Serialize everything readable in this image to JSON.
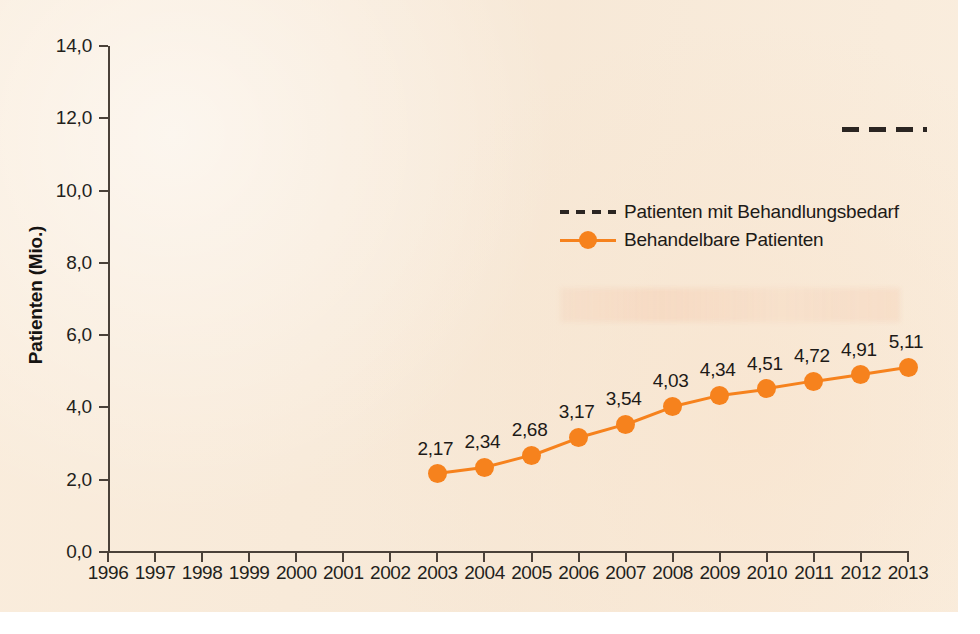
{
  "figure": {
    "background_color": "#f8ead8",
    "accent_color": "#f6821d",
    "dash_color": "#2b2522"
  },
  "axes": {
    "y_title": "Patienten (Mio.)",
    "y_ticks": [
      "0,0",
      "2,0",
      "4,0",
      "6,0",
      "8,0",
      "10,0",
      "12,0",
      "14,0"
    ],
    "x_ticks": [
      "1996",
      "1997",
      "1998",
      "1999",
      "2000",
      "2001",
      "2002",
      "2003",
      "2004",
      "2005",
      "2006",
      "2007",
      "2008",
      "2009",
      "2010",
      "2011",
      "2012",
      "2013"
    ]
  },
  "legend": {
    "items": [
      {
        "label": "Patienten mit Behandlungsbedarf",
        "style": "dashed",
        "color": "#2b2522"
      },
      {
        "label": "Behandelbare Patienten",
        "style": "line-marker",
        "color": "#f6821d"
      }
    ]
  },
  "point_labels": [
    "2,17",
    "2,34",
    "2,68",
    "3,17",
    "3,54",
    "4,03",
    "4,34",
    "4,51",
    "4,72",
    "4,91",
    "5,11"
  ],
  "chart_data": {
    "type": "line",
    "title": "",
    "subtitle": "",
    "xlabel": "",
    "ylabel": "Patienten (Mio.)",
    "x": [
      1996,
      1997,
      1998,
      1999,
      2000,
      2001,
      2002,
      2003,
      2004,
      2005,
      2006,
      2007,
      2008,
      2009,
      2010,
      2011,
      2012,
      2013
    ],
    "xlim": [
      1996,
      2013
    ],
    "ylim": [
      0,
      14
    ],
    "ytick_values": [
      0,
      2,
      4,
      6,
      8,
      10,
      12,
      14
    ],
    "grid": false,
    "legend_position": "center-right",
    "series": [
      {
        "name": "Behandelbare Patienten",
        "color": "#f6821d",
        "style": "solid-with-markers",
        "x": [
          2003,
          2004,
          2005,
          2006,
          2007,
          2008,
          2009,
          2010,
          2011,
          2012,
          2013
        ],
        "values": [
          2.17,
          2.34,
          2.68,
          3.17,
          3.54,
          4.03,
          4.34,
          4.51,
          4.72,
          4.91,
          5.11
        ],
        "data_labels": [
          "2,17",
          "2,34",
          "2,68",
          "3,17",
          "3,54",
          "4,03",
          "4,34",
          "4,51",
          "4,72",
          "4,91",
          "5,11"
        ]
      },
      {
        "name": "Patienten mit Behandlungsbedarf",
        "color": "#2b2522",
        "style": "dashed",
        "x": [
          2011.6,
          2013.4
        ],
        "values": [
          11.7,
          11.7
        ],
        "data_labels": []
      }
    ]
  }
}
